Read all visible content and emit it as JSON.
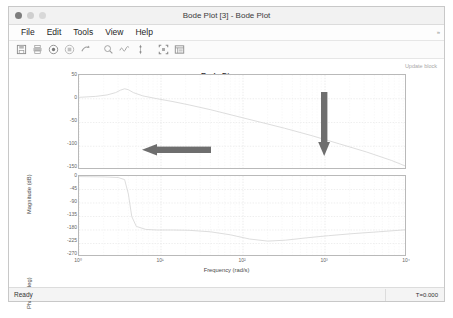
{
  "window": {
    "title": "Bode Plot [3] - Bode Plot",
    "buttons": [
      "close",
      "minimize",
      "maximize"
    ]
  },
  "menubar": {
    "items": [
      {
        "label": "File"
      },
      {
        "label": "Edit"
      },
      {
        "label": "Tools"
      },
      {
        "label": "View"
      },
      {
        "label": "Help"
      }
    ],
    "overflow_caret": "»"
  },
  "toolbar": {
    "buttons": [
      {
        "name": "save-icon",
        "title": "Save"
      },
      {
        "name": "print-icon",
        "title": "Print"
      },
      {
        "name": "record-icon",
        "title": "Record"
      },
      {
        "name": "stop-icon",
        "title": "Stop"
      },
      {
        "name": "step-forward-icon",
        "title": "Step Forward"
      },
      {
        "name": "zoom-icon",
        "title": "Zoom"
      },
      {
        "name": "waveform-icon",
        "title": "Signal"
      },
      {
        "name": "cursor-measure-icon",
        "title": "Cursor Measurements"
      },
      {
        "name": "fit-to-view-icon",
        "title": "Fit to View"
      },
      {
        "name": "legend-icon",
        "title": "Legend"
      }
    ]
  },
  "plot": {
    "update_block_label": "Update block"
  },
  "statusbar": {
    "ready_label": "Ready",
    "time_label": "T=0.000"
  },
  "chart_data": {
    "type": "line",
    "title": "Bode Diagram",
    "xlabel": "Frequency  (rad/s)",
    "xscale": "log",
    "xlim": [
      1,
      10000
    ],
    "xticks": [
      "10⁰",
      "10¹",
      "10²",
      "10³",
      "10⁴"
    ],
    "xtick_values": [
      1,
      10,
      100,
      1000,
      10000
    ],
    "grid": true,
    "legend": "none",
    "subplots": [
      {
        "name": "magnitude",
        "ylabel": "Magnitude (dB)",
        "yticks": [
          50,
          0,
          -50,
          -100,
          -150
        ],
        "ylim": [
          -150,
          50
        ],
        "series": [
          {
            "name": "magnitude-response",
            "color": "#d9d9d9",
            "x": [
              1,
              1.6,
              2.2,
              2.8,
              3.2,
              3.6,
              4.0,
              4.6,
              6,
              9,
              14,
              22,
              40,
              80,
              160,
              320,
              700,
              1500,
              3200,
              6500,
              10000
            ],
            "y": [
              3,
              5,
              8,
              13,
              18,
              21,
              19,
              13,
              6,
              0,
              -6,
              -13,
              -23,
              -36,
              -49,
              -62,
              -78,
              -95,
              -112,
              -130,
              -143
            ]
          }
        ]
      },
      {
        "name": "phase",
        "ylabel": "Phase (deg)",
        "yticks": [
          0,
          -45,
          -90,
          -135,
          -180,
          -225,
          -270
        ],
        "ylim": [
          -270,
          0
        ],
        "series": [
          {
            "name": "phase-response",
            "color": "#d9d9d9",
            "x": [
              1,
              2,
              3,
              3.6,
              4.0,
              4.4,
              5.0,
              6.5,
              9,
              14,
              22,
              40,
              70,
              120,
              200,
              330,
              600,
              1100,
              2200,
              4500,
              10000
            ],
            "y": [
              -2,
              -3,
              -5,
              -12,
              -60,
              -135,
              -168,
              -178,
              -180,
              -180,
              -181,
              -186,
              -196,
              -210,
              -217,
              -214,
              -206,
              -199,
              -192,
              -186,
              -179
            ]
          }
        ]
      }
    ],
    "annotations": [
      {
        "name": "peak-arrow",
        "type": "arrow",
        "direction": "left",
        "color": "#6e6e6e"
      },
      {
        "name": "rolloff-arrow",
        "type": "arrow",
        "direction": "down",
        "color": "#6e6e6e"
      }
    ]
  }
}
